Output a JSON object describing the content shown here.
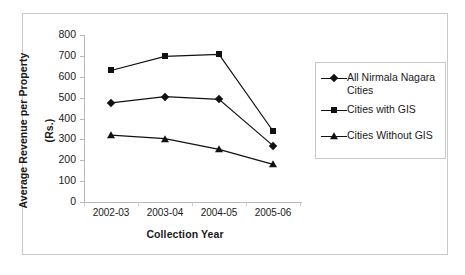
{
  "chart_data": {
    "type": "line",
    "title": "",
    "xlabel": "Collection Year",
    "ylabel": "Average Revenue per  Property (Rs.)",
    "ylabel_line1": "Average Revenue per  Property",
    "ylabel_line2": "(Rs.)",
    "categories": [
      "2002-03",
      "2003-04",
      "2004-05",
      "2005-06"
    ],
    "yticks": [
      0,
      100,
      200,
      300,
      400,
      500,
      600,
      700,
      800
    ],
    "ylim": [
      0,
      800
    ],
    "grid": false,
    "legend_position": "right",
    "series": [
      {
        "name": "All Nirmala Nagara Cities",
        "legend_label": "All Nirmala Nagara\nCities",
        "marker": "diamond",
        "color": "#111111",
        "values": [
          475,
          505,
          492,
          270
        ]
      },
      {
        "name": "Cities with GIS",
        "legend_label": "Cities with GIS",
        "marker": "square",
        "color": "#111111",
        "values": [
          630,
          698,
          707,
          340
        ]
      },
      {
        "name": "Cities Without GIS",
        "legend_label": "Cities Without GIS",
        "marker": "triangle",
        "color": "#111111",
        "values": [
          320,
          303,
          252,
          180
        ]
      }
    ]
  },
  "axis": {
    "tick_labels_y": [
      "800",
      "700",
      "600",
      "500",
      "400",
      "300",
      "200",
      "100",
      "0"
    ],
    "tick_labels_x": [
      "2002-03",
      "2003-04",
      "2004-05",
      "2005-06"
    ]
  },
  "legend": {
    "entries": [
      {
        "label": "All Nirmala Nagara\nCities",
        "marker": "diamond"
      },
      {
        "label": "Cities with GIS",
        "marker": "square"
      },
      {
        "label": "Cities Without GIS",
        "marker": "triangle"
      }
    ]
  }
}
